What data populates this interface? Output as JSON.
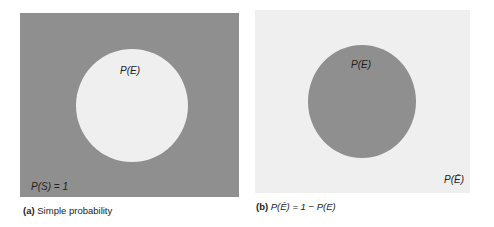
{
  "panels": [
    {
      "id": "a",
      "caption_tag": "(a)",
      "caption_text": "Simple probability",
      "outer_label": "P(S) = 1",
      "inner_label": "P(E)",
      "outer_color": "#8f8f8f",
      "inner_color": "#efefef"
    },
    {
      "id": "b",
      "caption_tag": "(b)",
      "caption_formula": "P(Ē) = 1 − P(E)",
      "outer_label": "P(Ē)",
      "inner_label": "P(E)",
      "outer_color": "#efefef",
      "inner_color": "#8f8f8f"
    }
  ],
  "text": {
    "a_inner": "P(E)",
    "a_outer": "P(S) = 1",
    "a_tag": "(a)",
    "a_caption": " Simple probability",
    "b_inner": "P(E)",
    "b_outer": "P(Ē)",
    "b_tag": "(b)",
    "b_caption": " P(Ē) = 1 − P(E)"
  }
}
